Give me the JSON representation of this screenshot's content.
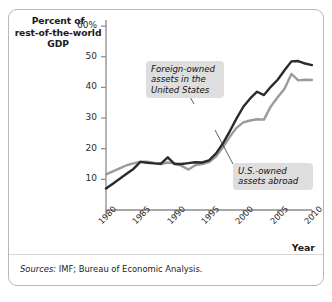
{
  "figure": {
    "y_axis_title": "Percent of rest-of-the-world GDP",
    "y_axis_title_lines": [
      "Percent of",
      "rest-of-the-world",
      "GDP"
    ],
    "x_axis_title": "Year",
    "sources_keyword": "Sources:",
    "sources_text": " IMF; Bureau of Economic Analysis.",
    "annotations": [
      {
        "id": "foreign-owned",
        "text": "Foreign-owned assets in the United States",
        "lines": [
          "Foreign-owned",
          "assets in the",
          "United States"
        ]
      },
      {
        "id": "us-owned",
        "text": "U.S.-owned assets abroad",
        "lines": [
          "U.S.-owned",
          "assets abroad"
        ]
      }
    ],
    "colors": {
      "foreign_line": "#2b2b2b",
      "us_line": "#9b9b9b",
      "axis": "#8d8b88",
      "callout_background": "#dedede",
      "frame": "#b9b7b4",
      "text": "#1a1a1a"
    }
  },
  "chart_data": {
    "type": "line",
    "title": "",
    "subtitle": "",
    "xlabel": "Year",
    "ylabel": "Percent of rest-of-the-world GDP",
    "xlim": [
      1980,
      2010
    ],
    "ylim": [
      0,
      62
    ],
    "grid": false,
    "legend_position": "inline-annotations",
    "ytick_labels": [
      "10",
      "20",
      "30",
      "40",
      "50",
      "60%"
    ],
    "ytick_values": [
      10,
      20,
      30,
      40,
      50,
      60
    ],
    "xtick_labels": [
      "1980",
      "1985",
      "1990",
      "1995",
      "2000",
      "2005",
      "2010"
    ],
    "xtick_values": [
      1980,
      1985,
      1990,
      1995,
      2000,
      2005,
      2010
    ],
    "x": [
      1980,
      1981,
      1982,
      1983,
      1984,
      1985,
      1986,
      1987,
      1988,
      1989,
      1990,
      1991,
      1992,
      1993,
      1994,
      1995,
      1996,
      1997,
      1998,
      1999,
      2000,
      2001,
      2002,
      2003,
      2004,
      2005,
      2006,
      2007,
      2008,
      2009,
      2010
    ],
    "series": [
      {
        "name": "Foreign-owned assets in the United States",
        "color": "#2b2b2b",
        "values": [
          7.0,
          8.6,
          10.2,
          11.8,
          13.4,
          15.7,
          15.4,
          15.2,
          15.1,
          17.2,
          15.0,
          15.0,
          15.3,
          15.6,
          15.5,
          16.2,
          18.4,
          21.6,
          25.6,
          29.8,
          33.7,
          36.4,
          38.6,
          37.5,
          40.2,
          42.5,
          45.6,
          48.5,
          48.6,
          47.8,
          47.3
        ]
      },
      {
        "name": "U.S.-owned assets abroad",
        "color": "#9b9b9b",
        "values": [
          11.6,
          12.6,
          13.6,
          14.6,
          15.2,
          15.8,
          15.8,
          15.4,
          15.0,
          15.5,
          15.2,
          14.4,
          13.2,
          14.6,
          15.0,
          15.6,
          17.4,
          20.4,
          23.8,
          26.8,
          28.6,
          29.2,
          29.6,
          29.5,
          33.8,
          36.8,
          39.6,
          44.4,
          42.3,
          42.5,
          42.4
        ]
      }
    ]
  }
}
